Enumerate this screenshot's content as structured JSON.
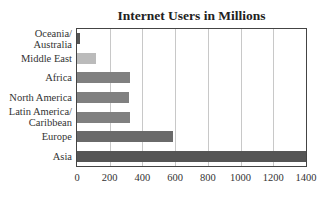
{
  "chart_data": {
    "type": "bar",
    "orientation": "horizontal",
    "title": "Internet Users in Millions",
    "xlabel": "",
    "ylabel": "",
    "categories": [
      "Oceania/\nAustralia",
      "Middle East",
      "Africa",
      "North America",
      "Latin America/\nCaribbean",
      "Europe",
      "Asia"
    ],
    "values": [
      21,
      115,
      321,
      315,
      324,
      588,
      1400
    ],
    "bar_colors": [
      "#555555",
      "#bbbbbb",
      "#808080",
      "#808080",
      "#808080",
      "#6a6a6a",
      "#555555"
    ],
    "xlim": [
      0,
      1400
    ],
    "xticks": [
      "0",
      "200",
      "400",
      "600",
      "800",
      "1000",
      "1200",
      "1400"
    ],
    "grid": "vertical",
    "legend": "none"
  }
}
